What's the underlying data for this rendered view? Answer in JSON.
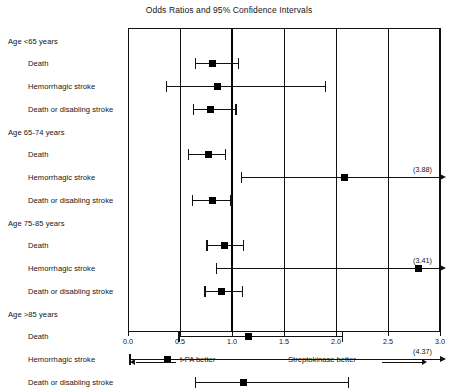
{
  "chart_data": {
    "type": "forest",
    "title": "Odds Ratios and 95% Confidence Intervals",
    "xlabel": "",
    "ylabel": "",
    "xlim": [
      0.0,
      3.0
    ],
    "xticks": [
      "0.0",
      "0.5",
      "1.0",
      "1.5",
      "2.0",
      "2.5",
      "3.0"
    ],
    "xtick_values": [
      0.0,
      0.5,
      1.0,
      1.5,
      2.0,
      2.5,
      3.0
    ],
    "reference_line": 1.0,
    "grid": true,
    "legend": "none",
    "left_direction_label": "t-PA better",
    "right_direction_label": "Streptokinase better",
    "groups": [
      {
        "label": "Age <65 years",
        "rows": [
          {
            "label": "Death",
            "or": 0.81,
            "low": 0.65,
            "high": 1.06,
            "truncated_high": false,
            "oob_label": ""
          },
          {
            "label": "Hemorrhagic stroke",
            "or": 0.86,
            "low": 0.37,
            "high": 1.9,
            "truncated_high": false,
            "oob_label": ""
          },
          {
            "label": "Death or disabling stroke",
            "or": 0.79,
            "low": 0.63,
            "high": 1.04,
            "truncated_high": false,
            "oob_label": ""
          }
        ]
      },
      {
        "label": "Age 65-74 years",
        "rows": [
          {
            "label": "Death",
            "or": 0.77,
            "low": 0.58,
            "high": 0.94,
            "truncated_high": false,
            "oob_label": ""
          },
          {
            "label": "Hemorrhagic stroke",
            "or": 2.08,
            "low": 1.09,
            "high": 3.88,
            "truncated_high": true,
            "oob_label": "(3.88)"
          },
          {
            "label": "Death or disabling stroke",
            "or": 0.81,
            "low": 0.62,
            "high": 0.99,
            "truncated_high": false,
            "oob_label": ""
          }
        ]
      },
      {
        "label": "Age 75-85 years",
        "rows": [
          {
            "label": "Death",
            "or": 0.93,
            "low": 0.76,
            "high": 1.11,
            "truncated_high": false,
            "oob_label": ""
          },
          {
            "label": "Hemorrhagic stroke",
            "or": 2.79,
            "low": 0.85,
            "high": 3.41,
            "truncated_high": true,
            "oob_label": "(3.41)"
          },
          {
            "label": "Death or disabling stroke",
            "or": 0.9,
            "low": 0.74,
            "high": 1.1,
            "truncated_high": false,
            "oob_label": ""
          }
        ]
      },
      {
        "label": "Age >85 years",
        "rows": [
          {
            "label": "Death",
            "or": 1.16,
            "low": 0.49,
            "high": 2.06,
            "truncated_high": false,
            "oob_label": ""
          },
          {
            "label": "Hemorrhagic stroke",
            "or": 0.38,
            "low": 0.02,
            "high": 4.37,
            "truncated_high": true,
            "oob_label": "(4.37)"
          },
          {
            "label": "Death or disabling stroke",
            "or": 1.11,
            "low": 0.65,
            "high": 2.12,
            "truncated_high": false,
            "oob_label": ""
          }
        ]
      }
    ]
  }
}
